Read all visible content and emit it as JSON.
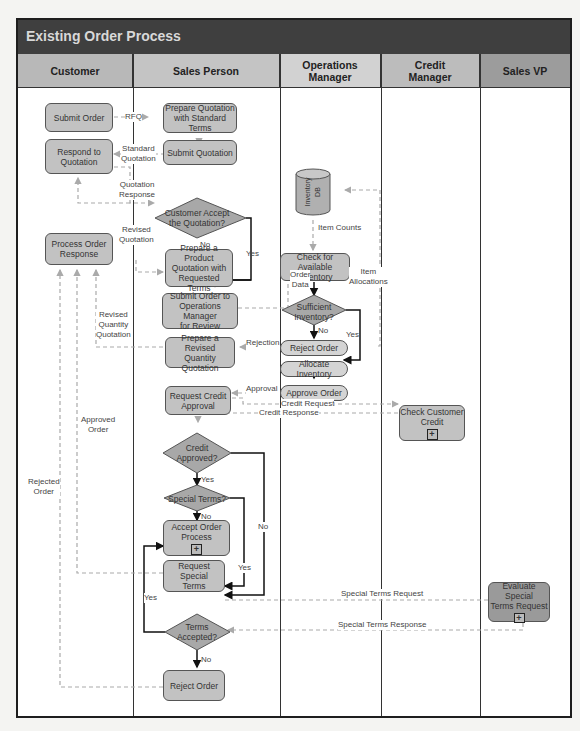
{
  "title": "Existing Order Process",
  "lanes": [
    {
      "label": "Customer",
      "color": "#b8b8b8"
    },
    {
      "label": "Sales Person",
      "color": "#c4c4c4"
    },
    {
      "label": "Operations\nManager",
      "color": "#d2d2d2"
    },
    {
      "label": "Credit\nManager",
      "color": "#bcbcbc"
    },
    {
      "label": "Sales VP",
      "color": "#9c9c9c"
    }
  ],
  "nodes": {
    "submit_order": "Submit Order",
    "respond_quotation": "Respond to\nQuotation",
    "process_order_response": "Process Order\nResponse",
    "prepare_quotation_standard": "Prepare Quotation\nwith Standard Terms",
    "submit_quotation": "Submit Quotation",
    "customer_accept": "Customer Accept\nthe Quotation?",
    "prepare_product_quotation": "Prepare a Product\nQuotation with\nRequested Terms",
    "submit_order_ops": "Submit Order to\nOperations Manager\nfor Review",
    "prepare_revised_quantity": "Prepare a Revised\nQuantity Quotation",
    "request_credit_approval": "Request Credit\nApproval",
    "credit_approved": "Credit\nApproved?",
    "special_terms": "Special Terms?",
    "accept_order_process": "Accept Order\nProcess",
    "request_special_terms": "Request Special\nTerms",
    "terms_accepted": "Terms\nAccepted?",
    "reject_order_sales": "Reject Order",
    "inventory_db": "Inventory\nDB",
    "check_inventory": "Check for\nAvailable Inventory",
    "sufficient_inventory": "Sufficient\nInventory?",
    "reject_order_ops": "Reject Order",
    "allocate_inventory": "Allocate Inventory",
    "approve_order": "Approve Order",
    "check_customer_credit": "Check Customer\nCredit",
    "evaluate_special_terms": "Evaluate Special\nTerms Request",
    "subprocess_marker": "+"
  },
  "labels": {
    "rfq": "RFQ",
    "standard_quotation": "Standard\nQuotation",
    "quotation_response": "Quotation\nResponse",
    "revised_quotation": "Revised\nQuotation",
    "no1": "No",
    "yes1": "Yes",
    "revised_quantity_quotation": "Revised\nQuantity\nQuotation",
    "approved_order": "Approved\nOrder",
    "rejected_order": "Rejected\nOrder",
    "item_counts": "Item Counts",
    "order_data": "Order\nData",
    "item_allocations": "Item\nAllocations",
    "no2": "No",
    "yes2": "Yes",
    "rejection": "Rejection",
    "approval": "Approval",
    "credit_request": "Credit Request",
    "credit_response": "Credit Response",
    "yes3": "Yes",
    "no3": "No",
    "yes4": "Yes",
    "no4": "No",
    "yes5": "Yes",
    "no5": "No",
    "special_terms_request": "Special Terms Request",
    "special_terms_response": "Special Terms Response"
  }
}
